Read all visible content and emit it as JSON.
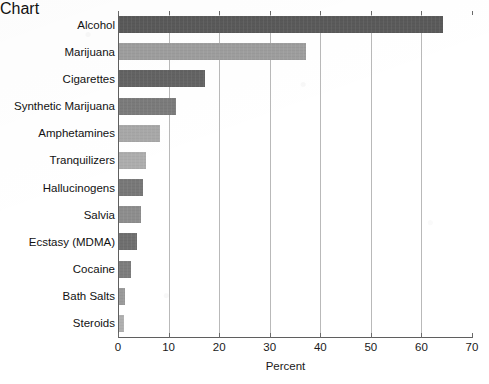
{
  "chart_data": {
    "type": "bar",
    "orientation": "horizontal",
    "title": "",
    "xlabel": "Percent",
    "ylabel": "",
    "xlim": [
      0,
      70
    ],
    "ylim": null,
    "xticks": [
      0,
      10,
      20,
      30,
      40,
      50,
      60,
      70
    ],
    "grid": "vertical",
    "legend": "none",
    "categories": [
      "Alcohol",
      "Marijuana",
      "Cigarettes",
      "Synthetic Marijuana",
      "Amphetamines",
      "Tranquilizers",
      "Hallucinogens",
      "Salvia",
      "Ecstasy (MDMA)",
      "Cocaine",
      "Bath Salts",
      "Steroids"
    ],
    "values": [
      64,
      37,
      17,
      11.2,
      8,
      5.4,
      4.8,
      4.3,
      3.6,
      2.3,
      1.2,
      1
    ],
    "bar_colors": [
      "#5a5a5a",
      "#9e9e9e",
      "#636363",
      "#7b7b7b",
      "#a8a8a8",
      "#adadad",
      "#787878",
      "#8d8d8d",
      "#6f6f6f",
      "#7d7d7d",
      "#9a9a9a",
      "#b0b0b0"
    ]
  },
  "axis": {
    "x_title": "Percent",
    "tick_labels": [
      "0",
      "10",
      "20",
      "30",
      "40",
      "50",
      "60",
      "70"
    ]
  },
  "style": {
    "grid_color": "#b9b9b9",
    "axis_color": "#5f5f5f",
    "text_color": "#121212",
    "background": "#ffffff"
  }
}
